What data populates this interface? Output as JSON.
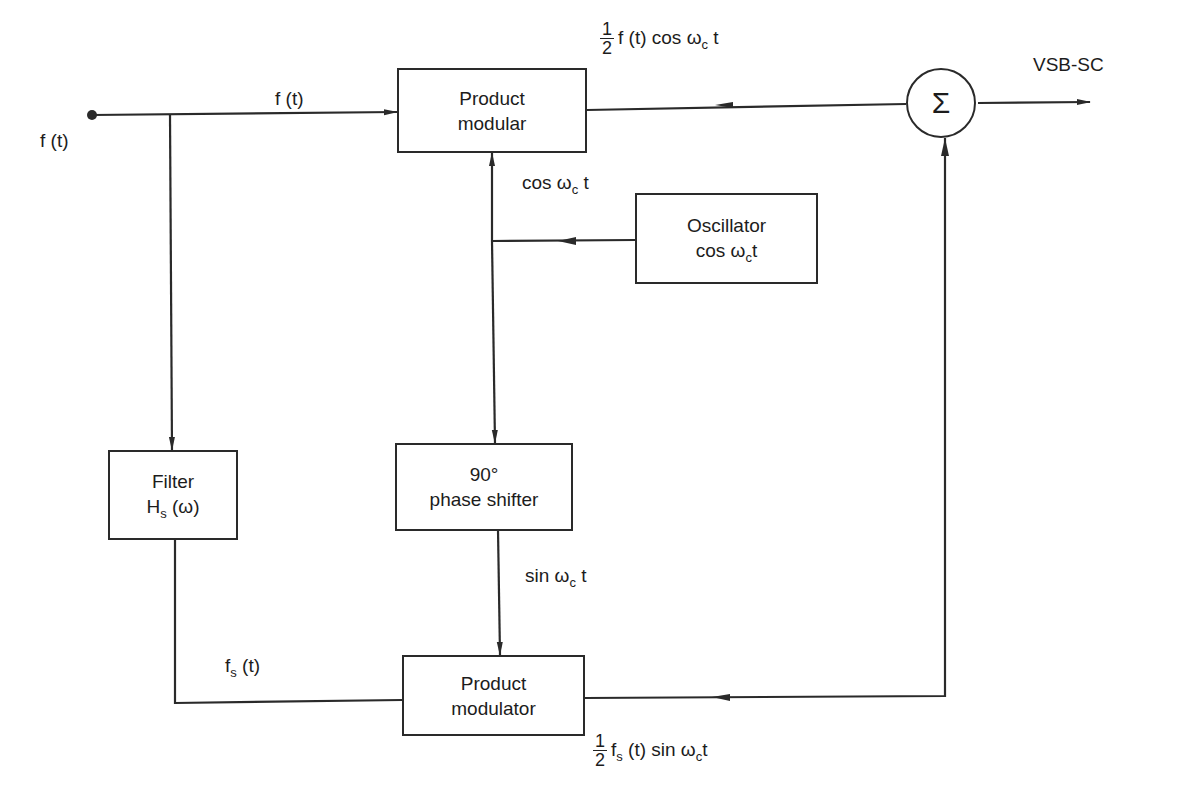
{
  "diagram": {
    "title_hint": "VSB-SC modulator (phase-shift method) block diagram",
    "blocks": {
      "product_modular": {
        "line1": "Product",
        "line2": "modular"
      },
      "oscillator": {
        "line1": "Oscillator",
        "line2_base": "cos ω",
        "line2_sub": "c",
        "line2_tail": "t"
      },
      "filter": {
        "line1": "Filter",
        "line2_base": "H",
        "line2_sub": "s",
        "line2_tail": " (ω)"
      },
      "phase_shifter": {
        "line1": "90°",
        "line2": "phase shifter"
      },
      "product_modulator": {
        "line1": "Product",
        "line2": "modulator"
      },
      "summer": {
        "symbol": "Σ"
      }
    },
    "signals": {
      "input_label": "f (t)",
      "input_to_modular": "f (t)",
      "carrier_cos": {
        "base": "cos ω",
        "sub": "c",
        "tail": " t"
      },
      "carrier_sin": {
        "base": "sin ω",
        "sub": "c",
        "tail": " t"
      },
      "filtered": {
        "base": "f",
        "sub": "s",
        "tail": " (t)"
      },
      "upper_output": {
        "num": "1",
        "den": "2",
        "expr_base": "f (t) cos ω",
        "expr_sub": "c",
        "expr_tail": " t"
      },
      "lower_output": {
        "num": "1",
        "den": "2",
        "expr_pre": "f",
        "expr_pre_sub": "s",
        "expr_base": " (t) sin ω",
        "expr_sub": "c",
        "expr_tail": "t"
      },
      "output": "VSB-SC"
    },
    "colors": {
      "line": "#2a2a2a",
      "background": "#ffffff"
    }
  }
}
